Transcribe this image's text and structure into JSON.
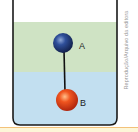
{
  "figure": {
    "layers": [
      {
        "name": "upper-liquid",
        "color": "#cfe3c4"
      },
      {
        "name": "lower-liquid",
        "color": "#c2dff0"
      }
    ],
    "spheres": [
      {
        "label": "A",
        "color": "#1f3a78"
      },
      {
        "label": "B",
        "color": "#e2401c"
      }
    ],
    "rod_color": "#111111",
    "beaker_color": "#1a1a1a"
  },
  "credit": "Reprodução/Arquivo da editora",
  "colors": {
    "band": "#fdf6d8",
    "band_line": "#f3c27a"
  }
}
